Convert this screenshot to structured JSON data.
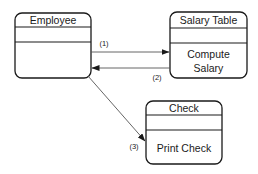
{
  "diagram": {
    "classes": [
      {
        "id": "employee",
        "name": "Employee",
        "attributes": [],
        "operations": []
      },
      {
        "id": "salary-table",
        "name": "Salary Table",
        "attributes": [],
        "operations": [
          "Compute",
          "Salary"
        ]
      },
      {
        "id": "check",
        "name": "Check",
        "attributes": [],
        "operations": [
          "Print Check"
        ]
      }
    ],
    "messages": [
      {
        "label": "(1)",
        "from": "employee",
        "to": "salary-table"
      },
      {
        "label": "(2)",
        "from": "salary-table",
        "to": "employee"
      },
      {
        "label": "(3)",
        "from": "employee",
        "to": "check"
      }
    ]
  }
}
